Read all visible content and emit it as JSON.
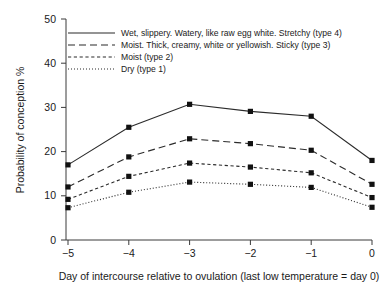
{
  "chart_data": {
    "type": "line",
    "title": "",
    "xlabel": "Day of intercourse relative to ovulation (last low temperature = day 0)",
    "ylabel": "Probability of conception %",
    "x": [
      -5,
      -4,
      -3,
      -2,
      -1,
      0
    ],
    "categories": [
      "−5",
      "−4",
      "−3",
      "−2",
      "−1",
      "0"
    ],
    "xlim": [
      -5,
      0
    ],
    "ylim": [
      0,
      50
    ],
    "yticks": [
      0,
      10,
      20,
      30,
      40,
      50
    ],
    "yticklabels": [
      "0",
      "10",
      "20",
      "30",
      "40",
      "50"
    ],
    "grid": false,
    "legend_position": "upper-left-inside",
    "series": [
      {
        "name": "Wet, slippery.  Watery, like raw egg white. Stretchy (type 4)",
        "linestyle": "solid",
        "marker": "square",
        "values": [
          17.0,
          25.5,
          30.7,
          29.1,
          28.0,
          18.0
        ]
      },
      {
        "name": "Moist.  Thick, creamy, white or yellowish. Sticky (type 3)",
        "linestyle": "dashed",
        "marker": "square",
        "values": [
          12.0,
          18.8,
          22.9,
          21.8,
          20.3,
          12.6
        ]
      },
      {
        "name": "Moist (type 2)",
        "linestyle": "short-dashed",
        "marker": "square",
        "values": [
          9.2,
          14.4,
          17.4,
          16.5,
          15.2,
          9.6
        ]
      },
      {
        "name": "Dry (type 1)",
        "linestyle": "dotted",
        "marker": "square",
        "values": [
          7.3,
          10.8,
          13.1,
          12.6,
          11.9,
          7.4
        ]
      }
    ]
  },
  "axes": {
    "ytick_0": "0",
    "ytick_1": "10",
    "ytick_2": "20",
    "ytick_3": "30",
    "ytick_4": "40",
    "ytick_5": "50",
    "xtick_0": "−5",
    "xtick_1": "−4",
    "xtick_2": "−3",
    "xtick_3": "−2",
    "xtick_4": "−1",
    "xtick_5": "0",
    "x_title": "Day of intercourse relative to ovulation (last low temperature = day 0)",
    "y_title": "Probability of conception %"
  },
  "legend": {
    "entry_0": "Wet, slippery.  Watery, like raw egg white. Stretchy (type 4)",
    "entry_1": "Moist.  Thick, creamy, white or yellowish. Sticky (type 3)",
    "entry_2": "Moist (type 2)",
    "entry_3": "Dry (type 1)"
  },
  "colors": {
    "line": "#2b2b2b",
    "marker": "#111111",
    "axis": "#3a3a3a",
    "text": "#1a1a1a",
    "background": "#ffffff"
  }
}
